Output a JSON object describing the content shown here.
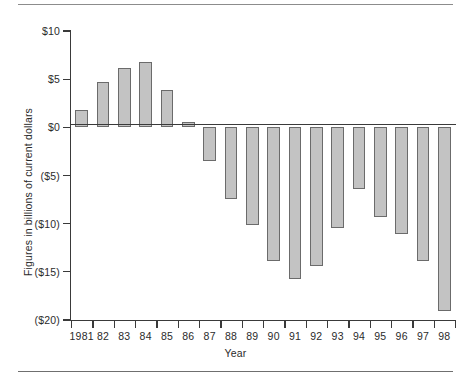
{
  "chart_data": {
    "type": "bar",
    "title": "",
    "xlabel": "Year",
    "ylabel": "Figures in billions of current dollars",
    "categories": [
      "1981",
      "82",
      "83",
      "84",
      "85",
      "86",
      "87",
      "88",
      "89",
      "90",
      "91",
      "92",
      "93",
      "94",
      "95",
      "96",
      "97",
      "98"
    ],
    "values": [
      1.8,
      4.7,
      6.2,
      6.8,
      3.9,
      0.6,
      -3.5,
      -7.4,
      -10.1,
      -13.9,
      -15.7,
      -14.4,
      -10.4,
      -6.4,
      -9.3,
      -11.1,
      -13.9,
      -19.1
    ],
    "ylim": [
      -20,
      10
    ],
    "ytick_values": [
      10,
      5,
      0,
      -5,
      -10,
      -15,
      -20
    ],
    "ytick_labels": [
      "$10",
      "$5",
      "$0",
      "($5)",
      "($10)",
      "($15)",
      "($20)"
    ],
    "grid": false,
    "legend": null,
    "bar_fill": "#c3c3c3",
    "bar_stroke": "#6b6b6b",
    "axis_color": "#3a3a3a"
  }
}
